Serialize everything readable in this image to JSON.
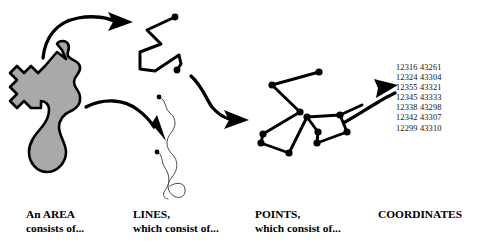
{
  "diagram": {
    "title_implied": "Spatial data decomposition",
    "colors": {
      "area_fill": "#a9a9a9",
      "outline": "#000000",
      "thin_line": "#4a4a4a",
      "text": "#000000",
      "coord_text": "#121212",
      "background": "#ffffff"
    },
    "shapes": {
      "area_polygon_label": "gray-area-polygon",
      "zigzag_polyline_label": "zigzag-line",
      "squiggle_line_1_label": "squiggle-line-left",
      "squiggle_line_2_label": "squiggle-line-right",
      "points_network_label": "points-network"
    },
    "arrows": [
      {
        "name": "arrow-area-to-lines",
        "from": "area",
        "to": "lines"
      },
      {
        "name": "arrow-area-to-squiggles",
        "from": "area",
        "to": "squiggles"
      },
      {
        "name": "arrow-lines-to-points",
        "from": "lines",
        "to": "points"
      },
      {
        "name": "arrow-points-to-coordinates",
        "from": "points",
        "to": "coordinates"
      }
    ]
  },
  "coordinates": {
    "list": [
      "12316 43261",
      "12324 43304",
      "12355 43321",
      "12345 43333",
      "12338 43298",
      "12342 43307",
      "12299 43310"
    ]
  },
  "captions": {
    "area": {
      "line1": "An AREA",
      "line2": "consists of..."
    },
    "lines": {
      "line1": "LINES,",
      "line2": "which consist of..."
    },
    "points": {
      "line1": "POINTS,",
      "line2": "which consist of..."
    },
    "coords": {
      "line1": "COORDINATES",
      "line2": ""
    }
  }
}
